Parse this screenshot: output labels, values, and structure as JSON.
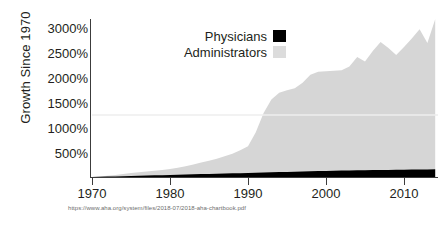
{
  "chart_data": {
    "type": "area",
    "title": "",
    "subtitle": "",
    "xlabel": "",
    "ylabel": "Growth Since 1970",
    "xlim": [
      1970,
      2014
    ],
    "ylim": [
      0,
      3200
    ],
    "grid": false,
    "legend_position": "top-center",
    "y_tick_labels": [
      "500%",
      "1000%",
      "1500%",
      "2000%",
      "2500%",
      "3000%"
    ],
    "y_tick_values": [
      500,
      1000,
      1500,
      2000,
      2500,
      3000
    ],
    "x_tick_labels": [
      "1970",
      "1980",
      "1990",
      "2000",
      "2010"
    ],
    "x_tick_values": [
      1970,
      1980,
      1990,
      2000,
      2010
    ],
    "x": [
      1970,
      1971,
      1972,
      1973,
      1974,
      1975,
      1976,
      1977,
      1978,
      1979,
      1980,
      1981,
      1982,
      1983,
      1984,
      1985,
      1986,
      1987,
      1988,
      1989,
      1990,
      1991,
      1992,
      1993,
      1994,
      1995,
      1996,
      1997,
      1998,
      1999,
      2000,
      2001,
      2002,
      2003,
      2004,
      2005,
      2006,
      2007,
      2008,
      2009,
      2010,
      2011,
      2012,
      2013,
      2014
    ],
    "series": [
      {
        "name": "Administrators",
        "color": "#d6d6d6",
        "values": [
          0,
          10,
          25,
          40,
          60,
          80,
          95,
          110,
          125,
          140,
          160,
          185,
          215,
          250,
          290,
          330,
          370,
          420,
          470,
          540,
          620,
          900,
          1290,
          1560,
          1700,
          1750,
          1790,
          1900,
          2060,
          2120,
          2130,
          2140,
          2150,
          2230,
          2420,
          2330,
          2540,
          2720,
          2600,
          2460,
          2620,
          2790,
          2980,
          2700,
          3180
        ]
      },
      {
        "name": "Physicians",
        "color": "#000000",
        "values": [
          0,
          4,
          8,
          12,
          17,
          21,
          25,
          29,
          33,
          37,
          42,
          46,
          50,
          54,
          58,
          62,
          66,
          70,
          74,
          78,
          83,
          87,
          91,
          95,
          99,
          103,
          107,
          111,
          115,
          119,
          123,
          126,
          129,
          131,
          134,
          136,
          139,
          141,
          143,
          145,
          147,
          149,
          151,
          153,
          155
        ]
      }
    ],
    "annotations": [
      {
        "type": "hline",
        "value": 1250,
        "color": "#eeeeee"
      }
    ],
    "source": "https://www.aha.org/system/files/2018-07/2018-aha-chartbook.pdf"
  },
  "legend": {
    "items": [
      {
        "label": "Physicians",
        "color": "#000000"
      },
      {
        "label": "Administrators",
        "color": "#dcdcdc"
      }
    ]
  },
  "axes": {
    "y_title": "Growth Since 1970"
  }
}
